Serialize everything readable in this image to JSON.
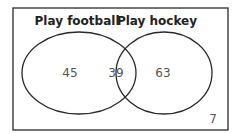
{
  "diagram": {
    "type": "venn",
    "sets": [
      {
        "name": "Play football",
        "only_count": "45"
      },
      {
        "name": "Play hockey",
        "only_count": "63"
      }
    ],
    "intersection_count": "39",
    "outside_count": "7",
    "colors": {
      "stroke": "#2a2a2a",
      "text": "#555555",
      "label": "#222222"
    }
  }
}
